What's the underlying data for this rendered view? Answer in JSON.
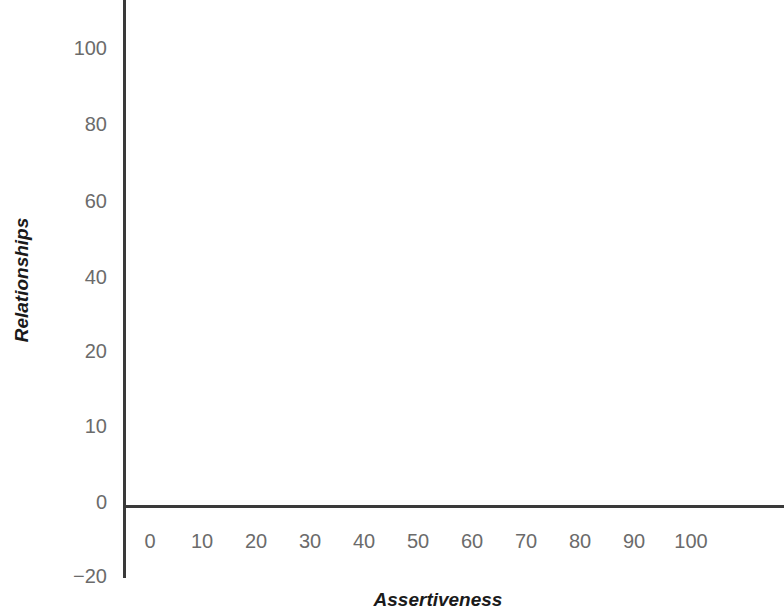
{
  "chart_data": {
    "type": "scatter",
    "title": "",
    "subtitle": "",
    "xlabel": "Assertiveness",
    "ylabel": "Relationships",
    "x": [],
    "y": [],
    "series": [],
    "annotations": [],
    "legend": [],
    "legend_position": "none",
    "grid": false,
    "xlim": [
      0,
      100
    ],
    "ylim": [
      -20,
      100
    ],
    "x_ticks": [
      "0",
      "10",
      "20",
      "30",
      "40",
      "50",
      "60",
      "70",
      "80",
      "90",
      "100"
    ],
    "y_ticks": [
      "100",
      "80",
      "60",
      "40",
      "20",
      "10",
      "0",
      "−20"
    ],
    "note": "Blank plotting grid with no data points rendered"
  },
  "axes": {
    "y_title": "Relationships",
    "x_title": "Assertiveness",
    "y_ticks": [
      {
        "label": "100",
        "top": 48
      },
      {
        "label": "80",
        "top": 124
      },
      {
        "label": "60",
        "top": 201
      },
      {
        "label": "40",
        "top": 277
      },
      {
        "label": "20",
        "top": 351
      },
      {
        "label": "10",
        "top": 426
      },
      {
        "label": "0",
        "top": 502
      },
      {
        "label": "−20",
        "top": 576
      }
    ],
    "x_ticks": [
      {
        "label": "0",
        "left": 150
      },
      {
        "label": "10",
        "left": 202
      },
      {
        "label": "20",
        "left": 256
      },
      {
        "label": "30",
        "left": 310
      },
      {
        "label": "40",
        "left": 364
      },
      {
        "label": "50",
        "left": 418
      },
      {
        "label": "60",
        "left": 472
      },
      {
        "label": "70",
        "left": 526
      },
      {
        "label": "80",
        "left": 580
      },
      {
        "label": "90",
        "left": 634
      },
      {
        "label": "100",
        "left": 691
      }
    ]
  },
  "colors": {
    "background": "#ffffff",
    "axis_line": "#3a3a3a",
    "tick_label": "#6b6b6b",
    "title_text": "#1a1a1a"
  }
}
